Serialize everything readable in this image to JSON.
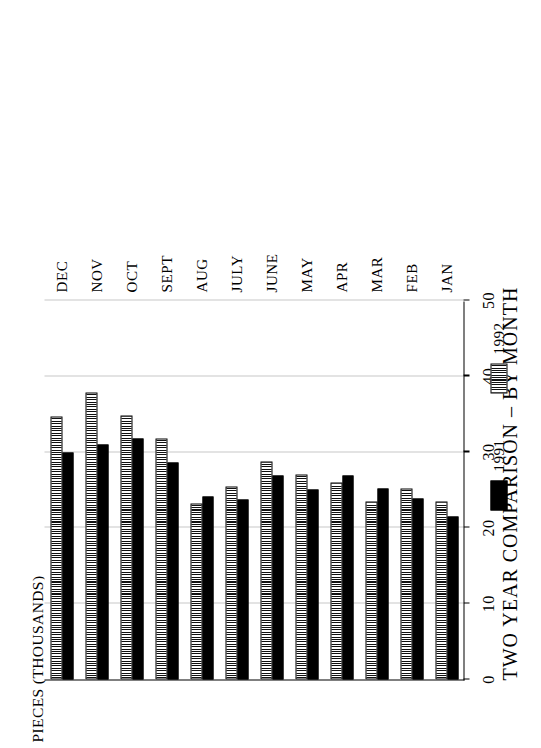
{
  "chart_data": {
    "type": "bar",
    "orientation": "horizontal",
    "title": "TWO YEAR COMPARISON  –  BY MONTH",
    "ylabel": "PIECES (THOUSANDS)",
    "xlabel": "",
    "categories": [
      "JAN",
      "FEB",
      "MAR",
      "APR",
      "MAY",
      "JUNE",
      "JULY",
      "AUG",
      "SEPT",
      "OCT",
      "NOV",
      "DEC"
    ],
    "series": [
      {
        "name": "1991",
        "values": [
          21.5,
          23.9,
          25.2,
          26.9,
          25.0,
          26.9,
          23.8,
          24.1,
          28.6,
          31.8,
          31.0,
          30.0
        ]
      },
      {
        "name": "1992",
        "values": [
          23.5,
          25.2,
          23.5,
          26.0,
          27.0,
          28.8,
          25.5,
          23.2,
          31.8,
          34.8,
          37.9,
          34.7
        ]
      }
    ],
    "axis_ticks": [
      "0",
      "10",
      "20",
      "30",
      "40",
      "50"
    ],
    "xlim": [
      0,
      50
    ],
    "grid": true,
    "legend_position": "bottom"
  },
  "legend": {
    "items": [
      {
        "label": "1991",
        "style": "solid",
        "color": "#000000"
      },
      {
        "label": "1992",
        "style": "hatched",
        "color": "#555555"
      }
    ]
  }
}
